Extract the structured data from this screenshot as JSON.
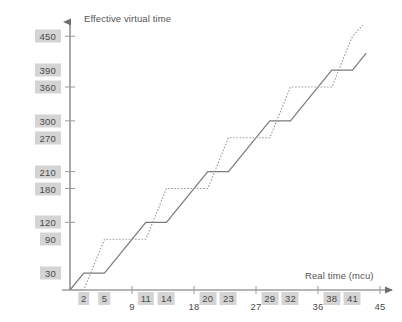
{
  "chart_data": {
    "type": "line",
    "title": "",
    "xlabel": "Real time (mcu)",
    "ylabel": "Effective virtual time",
    "xlim": [
      0,
      45
    ],
    "ylim": [
      0,
      470
    ],
    "grid": false,
    "legend": "none",
    "x_ticks": [
      {
        "value": 2,
        "label": "2",
        "style": "highlight"
      },
      {
        "value": 5,
        "label": "5",
        "style": "highlight"
      },
      {
        "value": 9,
        "label": "9",
        "style": "plain"
      },
      {
        "value": 11,
        "label": "11",
        "style": "highlight"
      },
      {
        "value": 14,
        "label": "14",
        "style": "highlight"
      },
      {
        "value": 18,
        "label": "18",
        "style": "plain"
      },
      {
        "value": 20,
        "label": "20",
        "style": "highlight"
      },
      {
        "value": 23,
        "label": "23",
        "style": "highlight"
      },
      {
        "value": 27,
        "label": "27",
        "style": "plain"
      },
      {
        "value": 29,
        "label": "29",
        "style": "highlight"
      },
      {
        "value": 32,
        "label": "32",
        "style": "highlight"
      },
      {
        "value": 36,
        "label": "36",
        "style": "plain"
      },
      {
        "value": 38,
        "label": "38",
        "style": "highlight"
      },
      {
        "value": 41,
        "label": "41",
        "style": "highlight"
      },
      {
        "value": 45,
        "label": "45",
        "style": "plain"
      }
    ],
    "y_ticks": [
      {
        "value": 30,
        "label": "30",
        "tick_mark": false
      },
      {
        "value": 90,
        "label": "90",
        "tick_mark": false
      },
      {
        "value": 120,
        "label": "120",
        "tick_mark": true
      },
      {
        "value": 180,
        "label": "180",
        "tick_mark": true
      },
      {
        "value": 210,
        "label": "210",
        "tick_mark": true
      },
      {
        "value": 270,
        "label": "270",
        "tick_mark": false
      },
      {
        "value": 300,
        "label": "300",
        "tick_mark": true
      },
      {
        "value": 360,
        "label": "360",
        "tick_mark": true
      },
      {
        "value": 390,
        "label": "390",
        "tick_mark": false
      },
      {
        "value": 450,
        "label": "450",
        "tick_mark": true
      }
    ],
    "series": [
      {
        "name": "solid-staircase",
        "style": "solid",
        "color": "#7a7a7a",
        "points": [
          [
            0,
            0
          ],
          [
            2,
            30
          ],
          [
            5,
            30
          ],
          [
            11,
            120
          ],
          [
            14,
            120
          ],
          [
            20,
            210
          ],
          [
            23,
            210
          ],
          [
            29,
            300
          ],
          [
            32,
            300
          ],
          [
            38,
            390
          ],
          [
            41,
            390
          ],
          [
            43,
            420
          ]
        ]
      },
      {
        "name": "dotted-staircase",
        "style": "dotted",
        "color": "#9a9a9a",
        "points": [
          [
            0,
            0
          ],
          [
            2,
            0
          ],
          [
            5,
            90
          ],
          [
            11,
            90
          ],
          [
            14,
            180
          ],
          [
            20,
            180
          ],
          [
            23,
            270
          ],
          [
            29,
            270
          ],
          [
            32,
            360
          ],
          [
            38,
            360
          ],
          [
            41,
            450
          ],
          [
            42.5,
            470
          ]
        ]
      }
    ]
  }
}
